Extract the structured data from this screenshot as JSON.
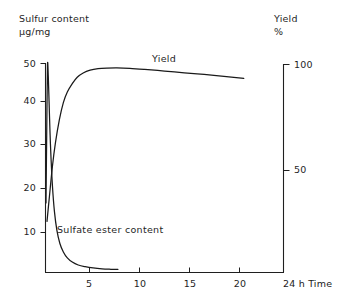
{
  "chart_data": {
    "type": "line",
    "title": "",
    "subtitle": "",
    "xlabel": "Time",
    "x_unit": "24 h",
    "xlim": [
      0,
      24
    ],
    "xticks": [
      5,
      10,
      15,
      20
    ],
    "xtick_labels": [
      "5",
      "10",
      "15",
      "20"
    ],
    "grid": false,
    "legend": "inline-annotations",
    "axes": [
      {
        "id": "left",
        "label": "Sulfur content",
        "unit": "µg/mg",
        "lim": [
          0,
          52
        ],
        "ticks": [
          10,
          20,
          30,
          40,
          50
        ],
        "tick_labels": [
          "10",
          "20",
          "30",
          "40",
          "50"
        ]
      },
      {
        "id": "right",
        "label": "Yield",
        "unit": "%",
        "lim": [
          0,
          104
        ],
        "ticks": [
          50,
          100
        ],
        "tick_labels": [
          "50",
          "100"
        ]
      }
    ],
    "series": [
      {
        "name": "Yield",
        "axis": "right",
        "annotation": "Yield",
        "x": [
          0.15,
          0.4,
          0.7,
          1.0,
          1.4,
          1.8,
          2.2,
          2.7,
          3.2,
          3.8,
          4.5,
          5.3,
          6.2,
          7.2,
          8.5,
          10.0,
          12.0,
          14.0,
          16.0,
          18.0,
          20.0
        ],
        "y": [
          26,
          38,
          52,
          63,
          74,
          82,
          87,
          91,
          94,
          96,
          97.3,
          98.0,
          98.3,
          98.4,
          98.2,
          97.7,
          96.9,
          96.1,
          95.3,
          94.4,
          93.5
        ]
      },
      {
        "name": "Sulfate ester content",
        "axis": "left",
        "annotation": "Sulfate ester content",
        "x": [
          0.05,
          0.12,
          0.2,
          0.28,
          0.36,
          0.45,
          0.55,
          0.7,
          0.9,
          1.15,
          1.45,
          1.8,
          2.2,
          2.7,
          3.3,
          4.0,
          4.8,
          5.7,
          6.6,
          7.3
        ],
        "y": [
          17.0,
          33.0,
          49.5,
          47.0,
          41.0,
          34.0,
          28.0,
          21.0,
          15.0,
          10.5,
          7.4,
          5.4,
          4.0,
          3.0,
          2.3,
          1.9,
          1.6,
          1.4,
          1.3,
          1.25
        ]
      }
    ],
    "colors": {
      "axis": "#1f1f1f",
      "yield_curve": "#1a1a1a",
      "sulfate_curve": "#1a1a1a",
      "background": "#ffffff"
    }
  },
  "left_axis": {
    "title_line1": "Sulfur content",
    "title_line2": "µg/mg",
    "tick_50": "50",
    "tick_40": "40",
    "tick_30": "30",
    "tick_20": "20",
    "tick_10": "10"
  },
  "right_axis": {
    "title_line1": "Yield",
    "title_line2": "%",
    "tick_100": "100",
    "tick_50": "50"
  },
  "x_axis": {
    "tick_5": "5",
    "tick_10": "10",
    "tick_15": "15",
    "tick_20": "20",
    "end_label": "24 h  Time"
  },
  "annotations": {
    "yield": "Yield",
    "sulfate": "Sulfate  ester  content"
  }
}
